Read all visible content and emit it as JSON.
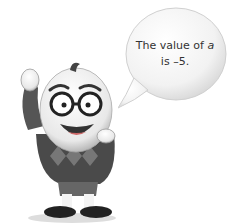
{
  "speech_bubble": {
    "line1_prefix": "The value of ",
    "variable": "a",
    "line2": "is –5."
  },
  "character": {
    "description": "cartoon egg-shaped character with glasses wearing argyle sweater"
  }
}
